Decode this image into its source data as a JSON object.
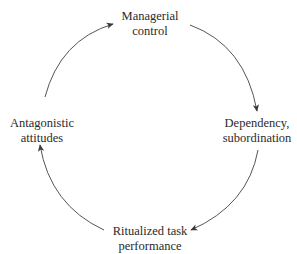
{
  "diagram": {
    "type": "cycle",
    "direction": "clockwise",
    "line_color": "#555555",
    "text_color": "#2a2a2a",
    "nodes": [
      {
        "id": "managerial",
        "line1": "Managerial",
        "line2": "control"
      },
      {
        "id": "dependency",
        "line1": "Dependency,",
        "line2": "subordination"
      },
      {
        "id": "ritualized",
        "line1": "Ritualized task",
        "line2": "performance"
      },
      {
        "id": "antagonistic",
        "line1": "Antagonistic",
        "line2": "attitudes"
      }
    ],
    "edges": [
      {
        "from": "managerial",
        "to": "dependency"
      },
      {
        "from": "dependency",
        "to": "ritualized"
      },
      {
        "from": "ritualized",
        "to": "antagonistic"
      },
      {
        "from": "antagonistic",
        "to": "managerial"
      }
    ]
  }
}
